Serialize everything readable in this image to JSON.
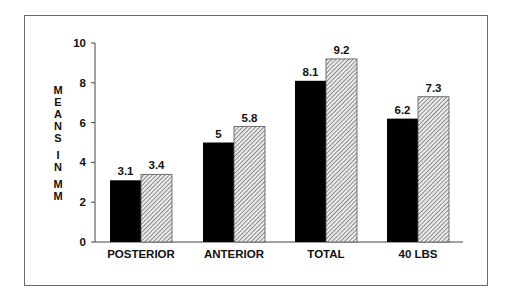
{
  "chart_data": {
    "type": "bar",
    "title": "",
    "xlabel": "",
    "ylabel": "MEANS IN MM",
    "ylabel_parts": [
      "MEANS",
      "IN",
      "MM"
    ],
    "ylim": [
      0,
      10
    ],
    "yticks": [
      0,
      2,
      4,
      6,
      8,
      10
    ],
    "categories": [
      "POSTERIOR",
      "ANTERIOR",
      "TOTAL",
      "40 LBS"
    ],
    "series": [
      {
        "name": "Series 1 (solid black)",
        "fill": "#000000",
        "values": [
          3.1,
          5,
          8.1,
          6.2
        ]
      },
      {
        "name": "Series 2 (hatched)",
        "fill": "hatched",
        "values": [
          3.4,
          5.8,
          9.2,
          7.3
        ]
      }
    ],
    "value_labels": [
      [
        "3.1",
        "3.4"
      ],
      [
        "5",
        "5.8"
      ],
      [
        "8.1",
        "9.2"
      ],
      [
        "6.2",
        "7.3"
      ]
    ],
    "grid": false,
    "legend": null
  },
  "colors": {
    "solid": "#000000",
    "hatch_line": "#555555",
    "hatch_bg": "#e8e8e8",
    "axis": "#444444",
    "frame": "#6a6a6a"
  }
}
